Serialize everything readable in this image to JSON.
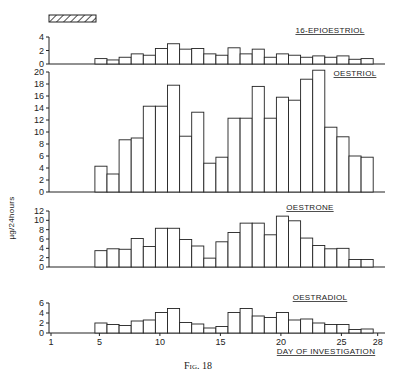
{
  "figure": {
    "caption": "Fig. 18",
    "ylabel": "µg/24hours",
    "xlabel": "DAY OF INVESTIGATION",
    "xticks": [
      "1",
      "5",
      "10",
      "15",
      "20",
      "25",
      "28"
    ]
  },
  "chart_data": [
    {
      "type": "bar",
      "title": "16-EPIOESTRIOL",
      "xlabel": "DAY OF INVESTIGATION",
      "ylabel": "µg/24hours",
      "ylim": [
        0,
        4
      ],
      "yticks": [
        0,
        2,
        4
      ],
      "x": [
        5,
        6,
        7,
        8,
        9,
        10,
        11,
        12,
        13,
        14,
        15,
        16,
        17,
        18,
        19,
        20,
        21,
        22,
        23,
        24,
        25,
        26,
        27
      ],
      "values": [
        0.8,
        0.6,
        1.0,
        1.5,
        1.3,
        2.3,
        3.0,
        2.2,
        2.3,
        1.5,
        1.3,
        2.4,
        1.5,
        2.2,
        1.0,
        1.5,
        1.3,
        1.0,
        1.2,
        1.0,
        1.2,
        0.7,
        0.8
      ]
    },
    {
      "type": "bar",
      "title": "OESTRIOL",
      "xlabel": "DAY OF INVESTIGATION",
      "ylabel": "µg/24hours",
      "ylim": [
        0,
        20
      ],
      "yticks": [
        0,
        2,
        4,
        6,
        8,
        10,
        12,
        14,
        16,
        18,
        20
      ],
      "x": [
        5,
        6,
        7,
        8,
        9,
        10,
        11,
        12,
        13,
        14,
        15,
        16,
        17,
        18,
        19,
        20,
        21,
        22,
        23,
        24,
        25,
        26,
        27
      ],
      "values": [
        4.3,
        3.0,
        8.7,
        9.0,
        14.3,
        14.3,
        17.8,
        9.3,
        13.3,
        4.8,
        5.8,
        12.3,
        12.3,
        17.6,
        12.3,
        15.8,
        15.3,
        18.8,
        20.3,
        10.8,
        9.2,
        6.0,
        5.8
      ]
    },
    {
      "type": "bar",
      "title": "OESTRONE",
      "xlabel": "DAY OF INVESTIGATION",
      "ylabel": "µg/24hours",
      "ylim": [
        0,
        12
      ],
      "yticks": [
        0,
        2,
        4,
        6,
        8,
        10,
        12
      ],
      "x": [
        5,
        6,
        7,
        8,
        9,
        10,
        11,
        12,
        13,
        14,
        15,
        16,
        17,
        18,
        19,
        20,
        21,
        22,
        23,
        24,
        25,
        26,
        27
      ],
      "values": [
        3.5,
        3.9,
        3.8,
        6.1,
        4.4,
        8.3,
        8.3,
        5.9,
        4.5,
        1.9,
        5.4,
        7.4,
        9.4,
        9.4,
        6.9,
        10.9,
        9.9,
        6.2,
        4.6,
        3.9,
        4.0,
        1.6,
        1.6
      ]
    },
    {
      "type": "bar",
      "title": "OESTRADIOL",
      "xlabel": "DAY OF INVESTIGATION",
      "ylabel": "µg/24hours",
      "ylim": [
        0,
        6
      ],
      "yticks": [
        0,
        2,
        4,
        6
      ],
      "x": [
        5,
        6,
        7,
        8,
        9,
        10,
        11,
        12,
        13,
        14,
        15,
        16,
        17,
        18,
        19,
        20,
        21,
        22,
        23,
        24,
        25,
        26,
        27
      ],
      "values": [
        2.0,
        1.7,
        1.5,
        2.4,
        2.6,
        4.1,
        4.9,
        2.1,
        1.8,
        1.0,
        1.3,
        4.1,
        4.9,
        3.4,
        3.1,
        4.1,
        2.6,
        2.8,
        2.0,
        1.7,
        1.7,
        0.7,
        0.8
      ]
    }
  ],
  "treatment_bar": {
    "label": "hatched period",
    "from_day": 1,
    "to_day": 5
  }
}
